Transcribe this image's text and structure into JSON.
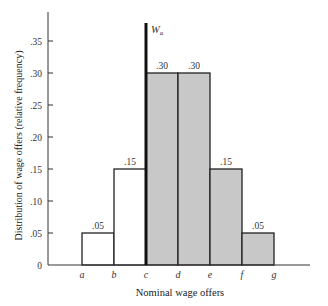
{
  "chart_data": {
    "type": "bar",
    "title": "",
    "xlabel": "Nominal wage offers",
    "ylabel": "Distribution of wage offers (relative frequency)",
    "categories": [
      "a-b",
      "b-c",
      "c-d",
      "d-e",
      "e-f",
      "f-g"
    ],
    "x_ticks": [
      "a",
      "b",
      "c",
      "d",
      "e",
      "f",
      "g"
    ],
    "y_ticks": [
      "0",
      ".05",
      ".10",
      ".15",
      ".20",
      ".25",
      ".30",
      ".35"
    ],
    "values": [
      0.05,
      0.15,
      0.3,
      0.3,
      0.15,
      0.05
    ],
    "bar_labels": [
      ".05",
      ".15",
      ".30",
      ".30",
      ".15",
      ".05"
    ],
    "shaded": [
      false,
      false,
      true,
      true,
      true,
      true
    ],
    "ylim": [
      0,
      0.38
    ],
    "grid": false,
    "annotations": [
      {
        "text": "W",
        "subscript": "a",
        "x": "c",
        "style": "vertical thick line"
      }
    ],
    "colors": {
      "shaded": "#c8c8c8",
      "unshaded": "#ffffff",
      "line": "#222222"
    }
  }
}
